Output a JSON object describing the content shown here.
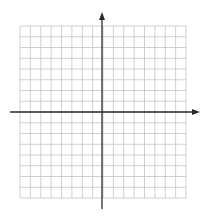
{
  "diagram": {
    "type": "coordinate-plane",
    "grid": {
      "columns": 16,
      "rows": 16,
      "left": 20,
      "top": 26,
      "right": 186,
      "bottom": 198,
      "line_color": "#c4c4c4"
    },
    "axes": {
      "color": "#2a2a2a",
      "x_axis": {
        "y": 112,
        "x_start": 10,
        "x_end": 200,
        "arrow": "right"
      },
      "y_axis": {
        "x": 102,
        "y_start": 12,
        "y_end": 209,
        "arrow": "up"
      }
    },
    "labels": []
  }
}
